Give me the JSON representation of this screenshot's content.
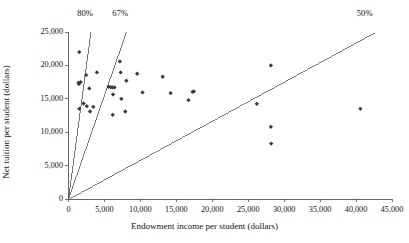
{
  "chart_data": {
    "type": "scatter",
    "title": "",
    "xlabel": "Endowment income per student (dollars)",
    "ylabel": "Net tuition per student (dollars)",
    "xlim": [
      0,
      45000
    ],
    "ylim": [
      0,
      25000
    ],
    "xticks": [
      0,
      5000,
      10000,
      15000,
      20000,
      25000,
      30000,
      35000,
      40000,
      45000
    ],
    "yticks": [
      0,
      5000,
      10000,
      15000,
      20000,
      25000
    ],
    "xtick_labels": [
      "0",
      "5,000",
      "10,000",
      "15,000",
      "20,000",
      "25,000",
      "30,000",
      "35,000",
      "40,000",
      "45,000"
    ],
    "ytick_labels": [
      "0",
      "5,000",
      "10,000",
      "15,000",
      "20,000",
      "25,000"
    ],
    "grid": false,
    "legend": "none",
    "marker": "diamond",
    "marker_color": "#3a3a3a",
    "axis_color": "#555555",
    "reference_lines": [
      {
        "label": "80%",
        "slope": 8.0,
        "x_end": 3125,
        "y_end": 25000,
        "label_x": 2300,
        "label_y": 25000
      },
      {
        "label": "67%",
        "slope": 3.1,
        "x_end": 8065,
        "y_end": 25000,
        "label_x": 7200,
        "label_y": 25000
      },
      {
        "label": "50%",
        "slope": 0.585,
        "x_end": 42700,
        "y_end": 25000,
        "label_x": 41200,
        "label_y": 25000
      }
    ],
    "points": [
      {
        "x": 1500,
        "y": 22000
      },
      {
        "x": 1400,
        "y": 17400
      },
      {
        "x": 1700,
        "y": 17500
      },
      {
        "x": 1450,
        "y": 17200
      },
      {
        "x": 2450,
        "y": 18550
      },
      {
        "x": 1500,
        "y": 13500
      },
      {
        "x": 2100,
        "y": 14300
      },
      {
        "x": 2900,
        "y": 16550
      },
      {
        "x": 2550,
        "y": 13900
      },
      {
        "x": 3000,
        "y": 13100
      },
      {
        "x": 3450,
        "y": 13800
      },
      {
        "x": 3950,
        "y": 18950
      },
      {
        "x": 5550,
        "y": 16800
      },
      {
        "x": 5850,
        "y": 16750
      },
      {
        "x": 6100,
        "y": 16700
      },
      {
        "x": 6400,
        "y": 16700
      },
      {
        "x": 6200,
        "y": 15650
      },
      {
        "x": 6150,
        "y": 12600
      },
      {
        "x": 7150,
        "y": 20600
      },
      {
        "x": 7250,
        "y": 18950
      },
      {
        "x": 7350,
        "y": 15000
      },
      {
        "x": 7900,
        "y": 13100
      },
      {
        "x": 8050,
        "y": 17700
      },
      {
        "x": 9550,
        "y": 18750
      },
      {
        "x": 10300,
        "y": 15950
      },
      {
        "x": 13100,
        "y": 18300
      },
      {
        "x": 14200,
        "y": 15850
      },
      {
        "x": 16700,
        "y": 14800
      },
      {
        "x": 17250,
        "y": 16050
      },
      {
        "x": 17450,
        "y": 16100
      },
      {
        "x": 26200,
        "y": 14250
      },
      {
        "x": 28150,
        "y": 20000
      },
      {
        "x": 28150,
        "y": 10800
      },
      {
        "x": 28200,
        "y": 8300
      },
      {
        "x": 40600,
        "y": 13500
      }
    ]
  }
}
